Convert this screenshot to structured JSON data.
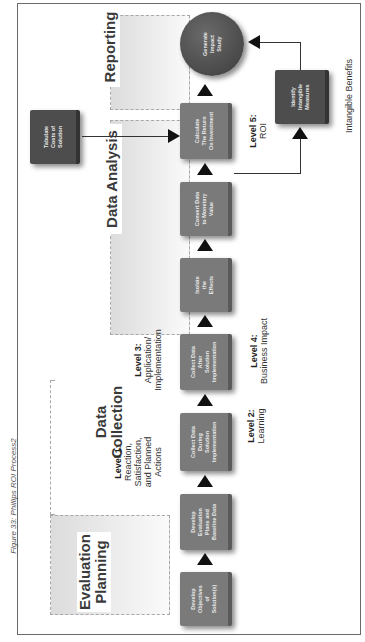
{
  "caption": "Figure 33: Phillips ROI Process2",
  "phases": [
    {
      "id": "evaluation-planning",
      "label": "Evaluation\nPlanning"
    },
    {
      "id": "data-collection",
      "label": "Data\nCollection"
    },
    {
      "id": "data-analysis",
      "label": "Data Analysis"
    },
    {
      "id": "reporting",
      "label": "Reporting"
    }
  ],
  "steps": [
    {
      "id": "develop-objectives",
      "label": "Develop\nObjectives\nof\nSolution(s)"
    },
    {
      "id": "develop-evaluation-plans",
      "label": "Develop\nEvaluation\nPlans and\nBaseline Data"
    },
    {
      "id": "collect-data-during",
      "label": "Collect Data\nDuring\nSolution\nImplementation"
    },
    {
      "id": "collect-data-after",
      "label": "Collect Data\nAfter\nSolution\nImplementation"
    },
    {
      "id": "isolate-effects",
      "label": "Isolate\nthe\nEffects"
    },
    {
      "id": "convert-data",
      "label": "Convert Data\nto Monetary\nValue"
    },
    {
      "id": "calculate-roi",
      "label": "Calculate\nThe Return\nOn Investment"
    },
    {
      "id": "tabulate-costs",
      "label": "Tabulate\nCosts of\nSolution"
    },
    {
      "id": "identify-intangibles",
      "label": "Identify\nIntangible\nMeasures"
    },
    {
      "id": "generate-impact-study",
      "label": "Generate\nImpact\nStudy"
    }
  ],
  "levels": [
    {
      "title": "Level 1:",
      "text": "Reaction,\nSatisfaction,\nand Planned\nActions"
    },
    {
      "title": "Level 2:",
      "text": "Learning"
    },
    {
      "title": "Level 3:",
      "text": "Application/\nImplementation"
    },
    {
      "title": "Level 4:",
      "text": "Business Impact"
    },
    {
      "title": "Level 5:",
      "text": "ROI"
    }
  ],
  "annotations": {
    "intangible_benefits": "Intangible Benefits"
  },
  "colors": {
    "box": "#7a7a7a",
    "box_dark": "#4d4d4d",
    "arrow": "#111111",
    "phase_bg": "#e4e4e4"
  }
}
